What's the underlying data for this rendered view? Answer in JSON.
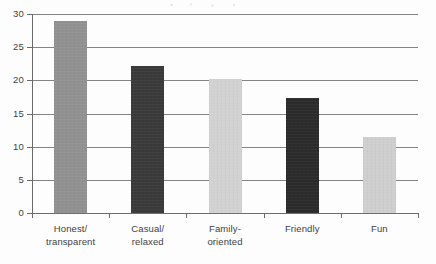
{
  "chart_data": {
    "type": "bar",
    "title": "",
    "xlabel": "",
    "ylabel": "",
    "ylim": [
      0,
      30
    ],
    "ytick_step": 5,
    "yticks": [
      30,
      25,
      20,
      15,
      10,
      5,
      0
    ],
    "grid": true,
    "legend": false,
    "categories": [
      "Honest/ transparent",
      "Casual/ relaxed",
      "Family- oriented",
      "Friendly",
      "Fun"
    ],
    "category_lines": [
      [
        "Honest/",
        "transparent"
      ],
      [
        "Casual/",
        "relaxed"
      ],
      [
        "Family-",
        "oriented"
      ],
      [
        "Friendly",
        ""
      ],
      [
        "Fun",
        ""
      ]
    ],
    "values": [
      29.0,
      22.1,
      20.2,
      17.3,
      11.4
    ],
    "bar_colors": [
      "#919191",
      "#3a3a3a",
      "#d2d2d2",
      "#2b2b2b",
      "#cfcfcf"
    ]
  },
  "axis": {
    "y_tick_labels": [
      "30",
      "25",
      "20",
      "15",
      "10",
      "5",
      "0"
    ]
  },
  "colors": {
    "gridline": "#6e6e6e",
    "axis": "#6a6a6a",
    "text": "#3f3f3f",
    "background": "#fdfdfd"
  }
}
